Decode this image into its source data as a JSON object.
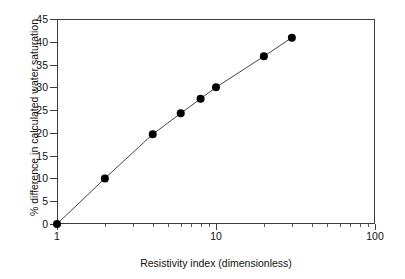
{
  "chart_data": {
    "type": "line",
    "title": "",
    "xlabel": "Resistivity index (dimensionless)",
    "ylabel": "% difference in calculated water saturation",
    "xscale": "log",
    "yscale": "linear",
    "xlim": [
      1,
      100
    ],
    "ylim": [
      0,
      45
    ],
    "grid": false,
    "legend": false,
    "x_tick_labels": [
      "1",
      "10",
      "100"
    ],
    "x_tick_values": [
      1,
      10,
      100
    ],
    "y_tick_labels": [
      "0",
      "5",
      "10",
      "15",
      "20",
      "25",
      "30",
      "35",
      "40",
      "45"
    ],
    "y_tick_values": [
      0,
      5,
      10,
      15,
      20,
      25,
      30,
      35,
      40,
      45
    ],
    "series": [
      {
        "name": "% difference in calculated water saturation",
        "marker": "filled-circle",
        "marker_color": "#000000",
        "line_color": "#444444",
        "x": [
          1,
          2,
          4,
          6,
          8,
          10,
          20,
          30
        ],
        "values": [
          0,
          10,
          19.7,
          24.3,
          27.5,
          30,
          36.8,
          40.9
        ]
      }
    ]
  },
  "axes": {
    "y_title": "% difference in calculated water saturation",
    "x_title": "Resistivity index (dimensionless)"
  }
}
